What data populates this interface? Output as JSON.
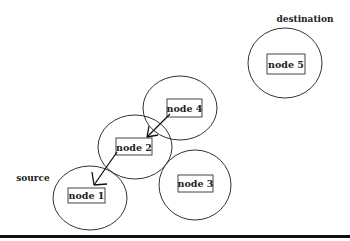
{
  "diagram": {
    "labels": {
      "destination": "destination",
      "source": "source"
    },
    "nodes": [
      {
        "id": "node1",
        "label": "node 1",
        "cx": 90,
        "cy": 198,
        "rx": 37,
        "ry": 32,
        "box": [
          68,
          188,
          37,
          15
        ]
      },
      {
        "id": "node2",
        "label": "node 2",
        "cx": 135,
        "cy": 147,
        "rx": 37,
        "ry": 32,
        "box": [
          116,
          138,
          36,
          17
        ]
      },
      {
        "id": "node3",
        "label": "node 3",
        "cx": 195,
        "cy": 185,
        "rx": 36,
        "ry": 35,
        "box": [
          178,
          175,
          35,
          17
        ]
      },
      {
        "id": "node4",
        "label": "node 4",
        "cx": 180,
        "cy": 108,
        "rx": 37,
        "ry": 32,
        "box": [
          167,
          99,
          35,
          18
        ]
      },
      {
        "id": "node5",
        "label": "node 5",
        "cx": 285,
        "cy": 63,
        "rx": 37,
        "ry": 35,
        "box": [
          267,
          54,
          38,
          20
        ]
      }
    ],
    "edges": [
      {
        "from": "node4",
        "to": "node2"
      },
      {
        "from": "node2",
        "to": "node1"
      }
    ],
    "colors": {
      "stroke": "#333333",
      "text": "#222222",
      "baseline": "#111111"
    }
  }
}
